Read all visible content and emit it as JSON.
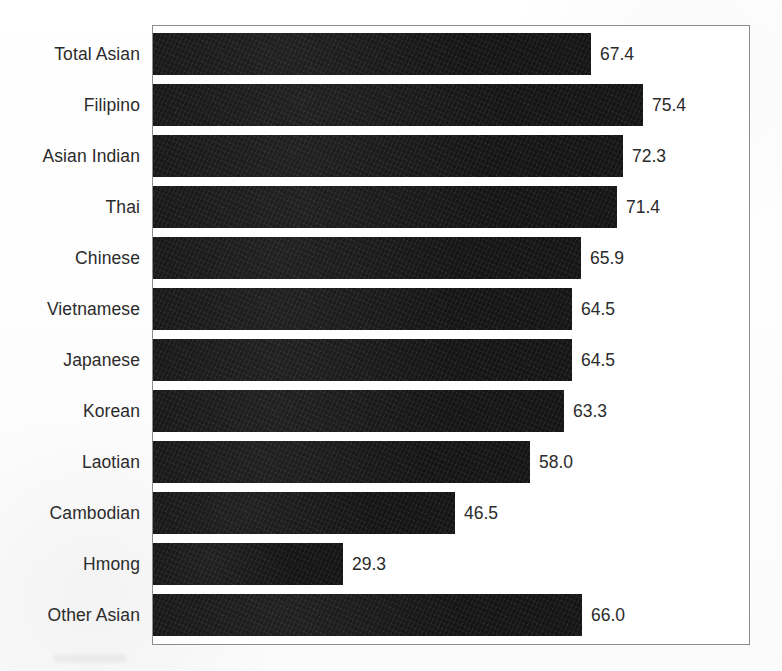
{
  "chart_data": {
    "type": "bar",
    "orientation": "horizontal",
    "title": "",
    "subtitle": "",
    "xlabel": "",
    "ylabel": "",
    "xlim": [
      0,
      92
    ],
    "grid": false,
    "legend": null,
    "bar_color": "#151515",
    "frame_color": "#8d8d8d",
    "background": "#ffffff",
    "value_label_format": "one-decimal",
    "categories": [
      "Total Asian",
      "Filipino",
      "Asian Indian",
      "Thai",
      "Chinese",
      "Vietnamese",
      "Japanese",
      "Korean",
      "Laotian",
      "Cambodian",
      "Hmong",
      "Other Asian"
    ],
    "values": [
      67.4,
      75.4,
      72.3,
      71.4,
      65.9,
      64.5,
      64.5,
      63.3,
      58.0,
      46.5,
      29.3,
      66.0
    ],
    "value_labels": [
      "67.4",
      "75.4",
      "72.3",
      "71.4",
      "65.9",
      "64.5",
      "64.5",
      "63.3",
      "58.0",
      "46.5",
      "29.3",
      "66.0"
    ]
  }
}
